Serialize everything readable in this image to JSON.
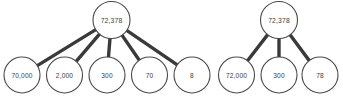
{
  "canvas": {
    "width": 343,
    "height": 102,
    "background_color": "#ffffff"
  },
  "style": {
    "edge_color": "#3a3a3c",
    "node_stroke_color": "#4a4a4d",
    "node_fill_color": "#ffffff",
    "text_color": "#3b3b3d"
  },
  "diagrams": [
    {
      "id": "left-decomposition",
      "name": "expanded-form-five-way",
      "root": {
        "label": "72,378",
        "cx": 111.5,
        "cy": 20.0,
        "r": 18.5
      },
      "leaves": [
        {
          "label": "70,000",
          "cx": 22.0,
          "cy": 75.0,
          "r": 18.0
        },
        {
          "label": "2,000",
          "cx": 64.5,
          "cy": 75.0,
          "r": 18.0
        },
        {
          "label": "300",
          "cx": 107.0,
          "cy": 75.0,
          "r": 18.0
        },
        {
          "label": "70",
          "cx": 149.5,
          "cy": 75.0,
          "r": 18.0
        },
        {
          "label": "8",
          "cx": 192.0,
          "cy": 75.0,
          "r": 18.0
        }
      ]
    },
    {
      "id": "right-decomposition",
      "name": "expanded-form-three-way",
      "root": {
        "label": "72,378",
        "cx": 279.0,
        "cy": 20.0,
        "r": 18.5
      },
      "leaves": [
        {
          "label": "72,000",
          "cx": 236.5,
          "cy": 75.0,
          "r": 18.0
        },
        {
          "label": "300",
          "cx": 279.0,
          "cy": 75.0,
          "r": 18.0
        },
        {
          "label": "78",
          "cx": 320.0,
          "cy": 75.0,
          "r": 18.0
        }
      ]
    }
  ]
}
